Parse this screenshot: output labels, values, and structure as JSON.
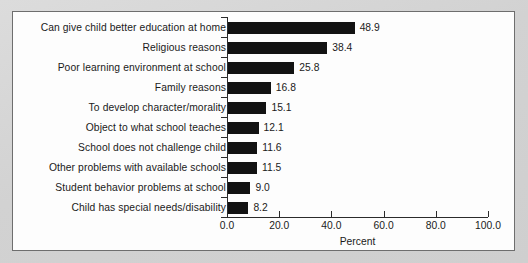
{
  "chart_data": {
    "type": "bar",
    "orientation": "horizontal",
    "title": "",
    "xlabel": "Percent",
    "ylabel": "",
    "xlim": [
      0,
      100
    ],
    "grid": false,
    "legend": null,
    "xticks": [
      "0.0",
      "20.0",
      "40.0",
      "60.0",
      "80.0",
      "100.0"
    ],
    "xtick_values": [
      0,
      20,
      40,
      60,
      80,
      100
    ],
    "categories": [
      "Can give child better education at home",
      "Religious reasons",
      "Poor learning environment at school",
      "Family reasons",
      "To develop character/morality",
      "Object to what school teaches",
      "School does not challenge child",
      "Other problems with available schools",
      "Student behavior problems at school",
      "Child has special needs/disability"
    ],
    "values": [
      48.9,
      38.4,
      25.8,
      16.8,
      15.1,
      12.1,
      11.6,
      11.5,
      9.0,
      8.2
    ],
    "value_labels": [
      "48.9",
      "38.4",
      "25.8",
      "16.8",
      "15.1",
      "12.1",
      "11.6",
      "11.5",
      "9.0",
      "8.2"
    ],
    "bar_color": "#121212",
    "axis_color": "#2b2b2b",
    "background_color": "#fdfdfd"
  }
}
